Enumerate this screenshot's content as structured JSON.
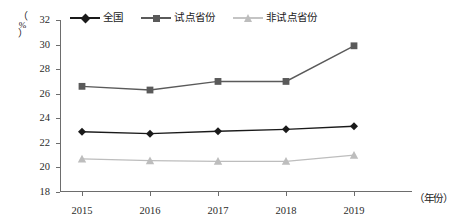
{
  "chart_data": {
    "type": "line",
    "title": "",
    "xlabel": "（年份）",
    "ylabel": "（%）",
    "categories": [
      "2015",
      "2016",
      "2017",
      "2018",
      "2019"
    ],
    "x": [
      2015,
      2016,
      2017,
      2018,
      2019
    ],
    "ylim": [
      18,
      32
    ],
    "yticks": [
      18,
      20,
      22,
      24,
      26,
      28,
      30,
      32
    ],
    "ytick_labels": [
      "18",
      "20",
      "22",
      "24",
      "26",
      "28",
      "30",
      "32"
    ],
    "grid": false,
    "legend_position": "top",
    "series": [
      {
        "name": "全国",
        "marker": "diamond",
        "color": "#1a1a1a",
        "values": [
          22.9,
          22.75,
          22.95,
          23.1,
          23.35
        ]
      },
      {
        "name": "试点省份",
        "marker": "square",
        "color": "#5a5a5a",
        "values": [
          26.6,
          26.3,
          27.0,
          27.0,
          29.9
        ]
      },
      {
        "name": "非试点省份",
        "marker": "triangle",
        "color": "#bdbdbd",
        "values": [
          20.7,
          20.55,
          20.5,
          20.5,
          21.0
        ]
      }
    ]
  },
  "legend": {
    "items": [
      {
        "label": "全国",
        "marker": "diamond",
        "color": "#1a1a1a"
      },
      {
        "label": "试点省份",
        "marker": "square",
        "color": "#5a5a5a"
      },
      {
        "label": "非试点省份",
        "marker": "triangle",
        "color": "#bdbdbd"
      }
    ]
  },
  "axes": {
    "y_unit_open": "（",
    "y_unit_symbol": "%",
    "y_unit_close": "）",
    "x_title": "（年份）"
  },
  "colors": {
    "axis": "#6d6d6d",
    "text": "#1a1a1a",
    "background": "#ffffff"
  }
}
